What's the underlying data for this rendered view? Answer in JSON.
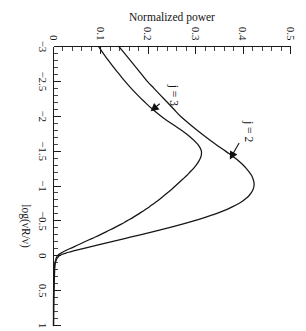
{
  "figure": {
    "orientation": "rotated-90-clockwise",
    "background_color": "#ffffff",
    "ink_color": "#151515"
  },
  "chart_data": {
    "type": "line",
    "title": "",
    "subtitle": "",
    "xlabel": "log(νR/ν)",
    "ylabel": "Normalized power",
    "xlim": [
      -3,
      1
    ],
    "ylim": [
      0,
      0.5
    ],
    "xticks": [
      -3,
      -2.5,
      -2,
      -1.5,
      -1,
      -0.5,
      0,
      0.5,
      1
    ],
    "xticklabels": [
      "−3",
      "−2.5",
      "−2",
      "−1.5",
      "−1",
      "−0.5",
      "0",
      "0.5",
      "1"
    ],
    "yticks": [
      0,
      0.1,
      0.2,
      0.3,
      0.4,
      0.5
    ],
    "yticklabels": [
      "0",
      "0.1",
      "0.2",
      "0.3",
      "0.4",
      "0.5"
    ],
    "xtick_minor_step": 0.1,
    "ytick_minor_step": 0.02,
    "grid": false,
    "legend": "inline-annotations",
    "annotations": [
      {
        "text": "j = 2",
        "label_x": -1.78,
        "label_y": 0.405,
        "target_x": -1.38,
        "target_y": 0.372
      },
      {
        "text": "j = 3",
        "label_x": -2.3,
        "label_y": 0.245,
        "target_x": -2.07,
        "target_y": 0.205
      }
    ],
    "series": [
      {
        "name": "j = 2",
        "label": "j = 2",
        "peak_x": -1.08,
        "peak_y": 0.423,
        "left_endpoint": [
          -3,
          0.138
        ],
        "right_endpoint": [
          1,
          0.0
        ],
        "points_x": [
          -3,
          -2.9,
          -2.8,
          -2.7,
          -2.6,
          -2.5,
          -2.4,
          -2.3,
          -2.2,
          -2.1,
          -2.0,
          -1.9,
          -1.8,
          -1.7,
          -1.6,
          -1.5,
          -1.45,
          -1.4,
          -1.35,
          -1.3,
          -1.25,
          -1.2,
          -1.15,
          -1.1,
          -1.05,
          -1.0,
          -0.95,
          -0.9,
          -0.85,
          -0.8,
          -0.75,
          -0.7,
          -0.65,
          -0.6,
          -0.55,
          -0.5,
          -0.45,
          -0.4,
          -0.35,
          -0.3,
          -0.25,
          -0.2,
          -0.15,
          -0.1,
          -0.05,
          0.0,
          0.1,
          0.3,
          0.6,
          1.0
        ],
        "points_y": [
          0.138,
          0.15,
          0.162,
          0.174,
          0.186,
          0.198,
          0.212,
          0.226,
          0.24,
          0.254,
          0.268,
          0.285,
          0.303,
          0.322,
          0.342,
          0.363,
          0.373,
          0.383,
          0.392,
          0.4,
          0.407,
          0.413,
          0.418,
          0.421,
          0.423,
          0.423,
          0.421,
          0.417,
          0.411,
          0.402,
          0.391,
          0.377,
          0.361,
          0.342,
          0.32,
          0.296,
          0.27,
          0.242,
          0.213,
          0.183,
          0.152,
          0.121,
          0.09,
          0.06,
          0.032,
          0.012,
          0.004,
          0.002,
          0.001,
          0.0
        ]
      },
      {
        "name": "j = 3",
        "label": "j = 3",
        "peak_x": -1.52,
        "peak_y": 0.312,
        "left_endpoint": [
          -3,
          0.095
        ],
        "right_endpoint": [
          1,
          0.0
        ],
        "points_x": [
          -3,
          -2.9,
          -2.8,
          -2.7,
          -2.6,
          -2.5,
          -2.4,
          -2.3,
          -2.2,
          -2.1,
          -2.0,
          -1.95,
          -1.9,
          -1.85,
          -1.8,
          -1.75,
          -1.7,
          -1.65,
          -1.6,
          -1.55,
          -1.5,
          -1.45,
          -1.4,
          -1.35,
          -1.3,
          -1.25,
          -1.2,
          -1.15,
          -1.1,
          -1.05,
          -1.0,
          -0.95,
          -0.9,
          -0.85,
          -0.8,
          -0.75,
          -0.7,
          -0.65,
          -0.6,
          -0.55,
          -0.5,
          -0.45,
          -0.4,
          -0.35,
          -0.3,
          -0.25,
          -0.2,
          -0.15,
          -0.1,
          -0.05,
          0.0,
          0.1,
          0.3,
          0.6,
          1.0
        ],
        "points_y": [
          0.095,
          0.105,
          0.116,
          0.127,
          0.139,
          0.151,
          0.164,
          0.178,
          0.193,
          0.209,
          0.227,
          0.237,
          0.248,
          0.259,
          0.27,
          0.28,
          0.289,
          0.297,
          0.304,
          0.309,
          0.312,
          0.312,
          0.31,
          0.306,
          0.301,
          0.295,
          0.288,
          0.281,
          0.273,
          0.265,
          0.257,
          0.249,
          0.24,
          0.231,
          0.222,
          0.212,
          0.202,
          0.191,
          0.18,
          0.168,
          0.155,
          0.142,
          0.128,
          0.113,
          0.098,
          0.082,
          0.066,
          0.05,
          0.034,
          0.019,
          0.008,
          0.003,
          0.001,
          0.0,
          0.0
        ]
      }
    ]
  }
}
